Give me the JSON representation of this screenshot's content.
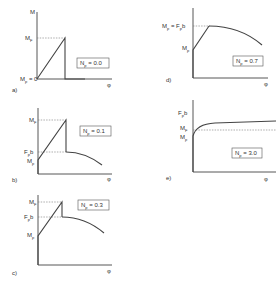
{
  "figure": {
    "axis_y_label": "M",
    "axis_x_label": "φ",
    "panels": [
      {
        "id": "a",
        "letter": "a)",
        "np_label": "Np = 0.0",
        "np_value": "0.0",
        "labels": [
          "MF",
          "Mp = 0"
        ]
      },
      {
        "id": "b",
        "letter": "b)",
        "np_label": "Np = 0.1",
        "np_value": "0.1",
        "labels": [
          "MF",
          "Fpb",
          "Mp"
        ]
      },
      {
        "id": "c",
        "letter": "c)",
        "np_label": "Np = 0.3",
        "np_value": "0.3",
        "labels": [
          "MF",
          "Fpb",
          "Mp"
        ]
      },
      {
        "id": "d",
        "letter": "d)",
        "np_label": "Np = 0.7",
        "np_value": "0.7",
        "labels": [
          "MF = Fpb",
          "Mp"
        ]
      },
      {
        "id": "e",
        "letter": "e)",
        "np_label": "Np = 3.0",
        "np_value": "3.0",
        "labels": [
          "Fpb",
          "MF",
          "Mp"
        ]
      }
    ]
  },
  "text": {
    "M": "M",
    "phi": "φ",
    "MF": "M",
    "F_sub": "F",
    "p_sub": "p",
    "Mp0": " = 0",
    "Fb_F": "F",
    "Fb_b": "b",
    "MF_eq": " = F",
    "a": "a)",
    "b": "b)",
    "c": "c)",
    "d": "d)",
    "e": "e)",
    "Np_N": "N",
    "np_a": " = 0.0",
    "np_b": " = 0.1",
    "np_c": " = 0.3",
    "np_d": " = 0.7",
    "np_e": " = 3.0"
  }
}
